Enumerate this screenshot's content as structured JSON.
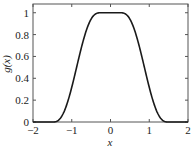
{
  "chart_data": {
    "type": "line",
    "title": "",
    "xlabel": "x",
    "ylabel": "g(x)",
    "xlim": [
      -2,
      2
    ],
    "ylim": [
      0,
      1.08
    ],
    "xticks": [
      -2,
      -1,
      0,
      1,
      2
    ],
    "xtick_labels": [
      "−2",
      "−1",
      "0",
      "1",
      "2"
    ],
    "yticks": [
      0,
      0.2,
      0.4,
      0.6,
      0.8,
      1
    ],
    "ytick_labels": [
      "0",
      "0.2",
      "0.4",
      "0.6",
      "0.8",
      "1"
    ],
    "grid": false,
    "legend": null,
    "series": [
      {
        "name": "g(x)",
        "color": "#1a1a1a",
        "x": [
          -2,
          -1.6,
          -1.5,
          -1.4,
          -1.3,
          -1.2,
          -1.1,
          -1.0,
          -0.9,
          -0.8,
          -0.7,
          -0.6,
          -0.5,
          -0.4,
          -0.3,
          -0.2,
          0,
          0.2,
          0.3,
          0.4,
          0.5,
          0.6,
          0.7,
          0.8,
          0.9,
          1.0,
          1.1,
          1.2,
          1.3,
          1.4,
          1.5,
          1.6,
          2
        ],
        "y": [
          0,
          0,
          0.0,
          0.02,
          0.07,
          0.16,
          0.3,
          0.45,
          0.6,
          0.73,
          0.84,
          0.92,
          0.97,
          0.99,
          1.0,
          1.0,
          1.0,
          1.0,
          1.0,
          0.99,
          0.97,
          0.92,
          0.84,
          0.73,
          0.6,
          0.45,
          0.3,
          0.16,
          0.07,
          0.02,
          0.0,
          0,
          0
        ]
      }
    ]
  }
}
